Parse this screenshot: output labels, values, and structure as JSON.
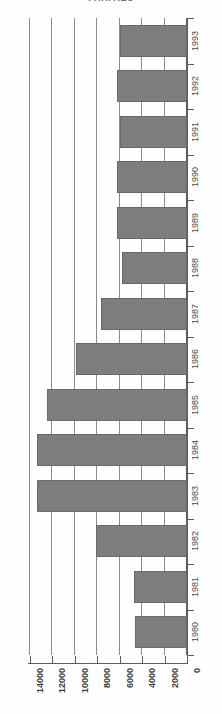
{
  "chart": {
    "title": "PARITIES",
    "axis_orientation": "horizontal-bars-value-axis-right-to-left",
    "bar_color": "#7d7d7d",
    "grid_color": "#8a8a8a",
    "axis_color": "#5d5d5d"
  },
  "chart_data": {
    "type": "bar",
    "title": "PARITIES",
    "xlabel": "",
    "ylabel": "",
    "orientation": "horizontal",
    "grid": true,
    "legend": null,
    "xlim": [
      0,
      14000
    ],
    "xticks": [
      14000,
      12000,
      10000,
      8000,
      6000,
      4000,
      2000,
      0
    ],
    "xtick_labels": [
      "14000",
      "12000",
      "10000",
      "8000",
      "6000",
      "4000",
      "2000",
      "0"
    ],
    "categories": [
      "1993",
      "1992",
      "1991",
      "1990",
      "1989",
      "1988",
      "1987",
      "1986",
      "1985",
      "1984",
      "1983",
      "1982",
      "1981",
      "1980"
    ],
    "values": [
      6000,
      6200,
      6000,
      6200,
      6200,
      5800,
      7700,
      9900,
      12500,
      13400,
      13400,
      8100,
      4700,
      4600
    ]
  }
}
